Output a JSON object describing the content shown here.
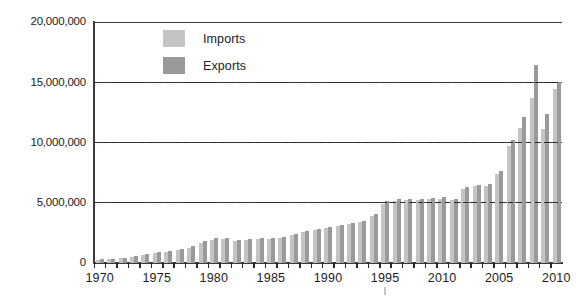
{
  "chart_data": {
    "type": "bar",
    "title": "",
    "xlabel": "",
    "ylabel": "",
    "ylim": [
      0,
      20000000
    ],
    "grid": true,
    "legend_position": "top-center",
    "y_ticks": [
      "0",
      "5,000,000",
      "10,000,000",
      "15,000,000",
      "20,000,000"
    ],
    "y_tick_values": [
      0,
      5000000,
      10000000,
      15000000,
      20000000
    ],
    "x_tick_labels": [
      "1970",
      "1975",
      "1980",
      "1985",
      "1990",
      "1995",
      "2010",
      "2005",
      "2010"
    ],
    "x_tick_years": [
      1970,
      1975,
      1980,
      1985,
      1990,
      1995,
      2000,
      2005,
      2010
    ],
    "categories": [
      "1970",
      "1971",
      "1972",
      "1973",
      "1974",
      "1975",
      "1976",
      "1977",
      "1978",
      "1979",
      "1980",
      "1981",
      "1982",
      "1983",
      "1984",
      "1985",
      "1986",
      "1987",
      "1988",
      "1989",
      "1990",
      "1991",
      "1992",
      "1993",
      "1994",
      "1995",
      "1996",
      "1997",
      "1998",
      "1999",
      "2000",
      "2001",
      "2002",
      "2003",
      "2004",
      "2005",
      "2006",
      "2007",
      "2008",
      "2009",
      "2010"
    ],
    "series": [
      {
        "name": "Imports",
        "color": "#c4c4c4",
        "values": [
          250000,
          300000,
          380000,
          500000,
          700000,
          820000,
          900000,
          1050000,
          1250000,
          1650000,
          1950000,
          2020000,
          1820000,
          1900000,
          2000000,
          2000000,
          2100000,
          2300000,
          2550000,
          2700000,
          2900000,
          3050000,
          3250000,
          3400000,
          3900000,
          4900000,
          5150000,
          5250000,
          5200000,
          5300000,
          5350000,
          5250000,
          6150000,
          6350000,
          6400000,
          7350000,
          9700000,
          11200000,
          13700000,
          11150000,
          14400000
        ]
      },
      {
        "name": "Exports",
        "color": "#9a9a9a",
        "values": [
          300000,
          330000,
          420000,
          560000,
          780000,
          880000,
          980000,
          1150000,
          1400000,
          1800000,
          2080000,
          2080000,
          1900000,
          1980000,
          2050000,
          2080000,
          2180000,
          2400000,
          2650000,
          2800000,
          3000000,
          3150000,
          3350000,
          3500000,
          4100000,
          5150000,
          5300000,
          5350000,
          5300000,
          5400000,
          5450000,
          5350000,
          6300000,
          6500000,
          6550000,
          7600000,
          10200000,
          12100000,
          16400000,
          12400000,
          15000000
        ]
      }
    ],
    "legend": [
      {
        "label": "Imports",
        "color": "#c4c4c4"
      },
      {
        "label": "Exports",
        "color": "#9a9a9a"
      }
    ]
  }
}
